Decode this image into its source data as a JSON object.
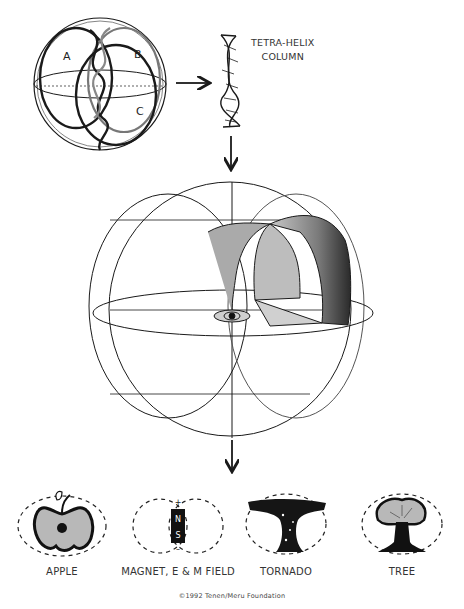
{
  "diagram": {
    "top": {
      "sphere_labels": [
        "A",
        "B",
        "C"
      ],
      "helix_label_line1": "TETRA-HELIX",
      "helix_label_line2": "COLUMN"
    },
    "examples": [
      {
        "label": "APPLE"
      },
      {
        "label": "MAGNET, E & M FIELD",
        "magnet_n": "N",
        "magnet_s": "S",
        "plus": "+",
        "minus": "–"
      },
      {
        "label": "TORNADO"
      },
      {
        "label": "TREE"
      }
    ],
    "copyright": "©1992 Tenen/Meru Foundation",
    "colors": {
      "line": "#1a1a1a",
      "gray_fill": "#b8b8b8",
      "dark_fill": "#333333"
    }
  }
}
